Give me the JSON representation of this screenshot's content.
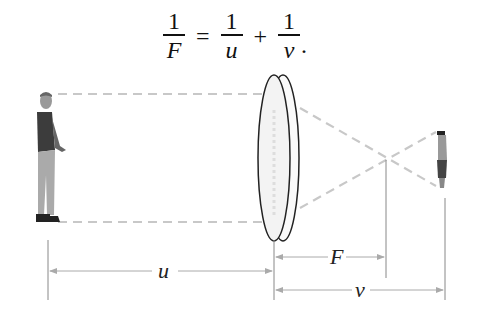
{
  "formula": {
    "lhs": {
      "numerator": "1",
      "denominator": "F"
    },
    "equals": "=",
    "term1": {
      "numerator": "1",
      "denominator": "u"
    },
    "plus": "+",
    "term2": {
      "numerator": "1",
      "denominator": "v"
    },
    "end": "."
  },
  "diagram": {
    "object_label": "person (object)",
    "lens_label": "lens",
    "image_label": "inverted image",
    "distances": {
      "u": "u",
      "F": "F",
      "v": "v"
    },
    "colors": {
      "ray": "#c8c8c8",
      "lens": "#222222",
      "dimension": "#9a9a9a"
    }
  }
}
